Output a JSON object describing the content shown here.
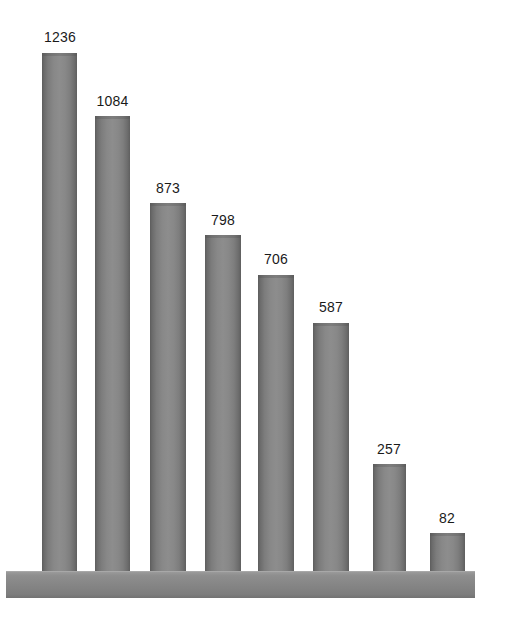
{
  "chart_data": {
    "type": "bar",
    "title": "",
    "subtitle": "",
    "xlabel": "",
    "ylabel": "",
    "categories": [
      "1",
      "2",
      "3",
      "4",
      "5",
      "6",
      "7",
      "8"
    ],
    "values": [
      1236,
      1084,
      873,
      798,
      706,
      587,
      257,
      82
    ],
    "labels": [
      "1236",
      "1084",
      "873",
      "798",
      "706",
      "587",
      "257",
      "82"
    ],
    "series": [
      {
        "name": "",
        "values": [
          1236,
          1084,
          873,
          798,
          706,
          587,
          257,
          82
        ]
      }
    ],
    "ylim": [
      0,
      1236
    ],
    "grid": false,
    "legend": false,
    "legend_position": "none",
    "axis_visible": false,
    "tick_labels_x": [],
    "tick_labels_y": [],
    "data_labels_shown": true,
    "orientation": "vertical",
    "sorted": "descending",
    "bar_style": "cylinder-3d",
    "background_color": "#ffffff",
    "bar_color": "#868686",
    "bar_edge_dark": "#5d5d5d",
    "bar_highlight": "#8d8d8d",
    "label_color": "#1a1a1a",
    "baseline_color": "#868686"
  },
  "geometry": {
    "width": 506,
    "height": 623,
    "baseline_top": 571,
    "baseline_slab": {
      "x": 6,
      "y": 571,
      "width": 469,
      "height": 27
    },
    "bars": [
      {
        "x": 42,
        "y": 53,
        "width": 35,
        "height": 518,
        "label_x": 42,
        "label_y": 30,
        "label_width": 36
      },
      {
        "x": 95,
        "y": 116,
        "width": 35,
        "height": 455,
        "label_x": 94,
        "label_y": 94,
        "label_width": 37
      },
      {
        "x": 150,
        "y": 203,
        "width": 36,
        "height": 368,
        "label_x": 150,
        "label_y": 181,
        "label_width": 36
      },
      {
        "x": 205,
        "y": 235,
        "width": 36,
        "height": 336,
        "label_x": 205,
        "label_y": 213,
        "label_width": 36
      },
      {
        "x": 258,
        "y": 275,
        "width": 36,
        "height": 296,
        "label_x": 258,
        "label_y": 252,
        "label_width": 36
      },
      {
        "x": 313,
        "y": 323,
        "width": 36,
        "height": 248,
        "label_x": 313,
        "label_y": 300,
        "label_width": 36
      },
      {
        "x": 373,
        "y": 464,
        "width": 33,
        "height": 107,
        "label_x": 371,
        "label_y": 442,
        "label_width": 36
      },
      {
        "x": 430,
        "y": 533,
        "width": 35,
        "height": 38,
        "label_x": 429,
        "label_y": 511,
        "label_width": 36
      }
    ]
  }
}
